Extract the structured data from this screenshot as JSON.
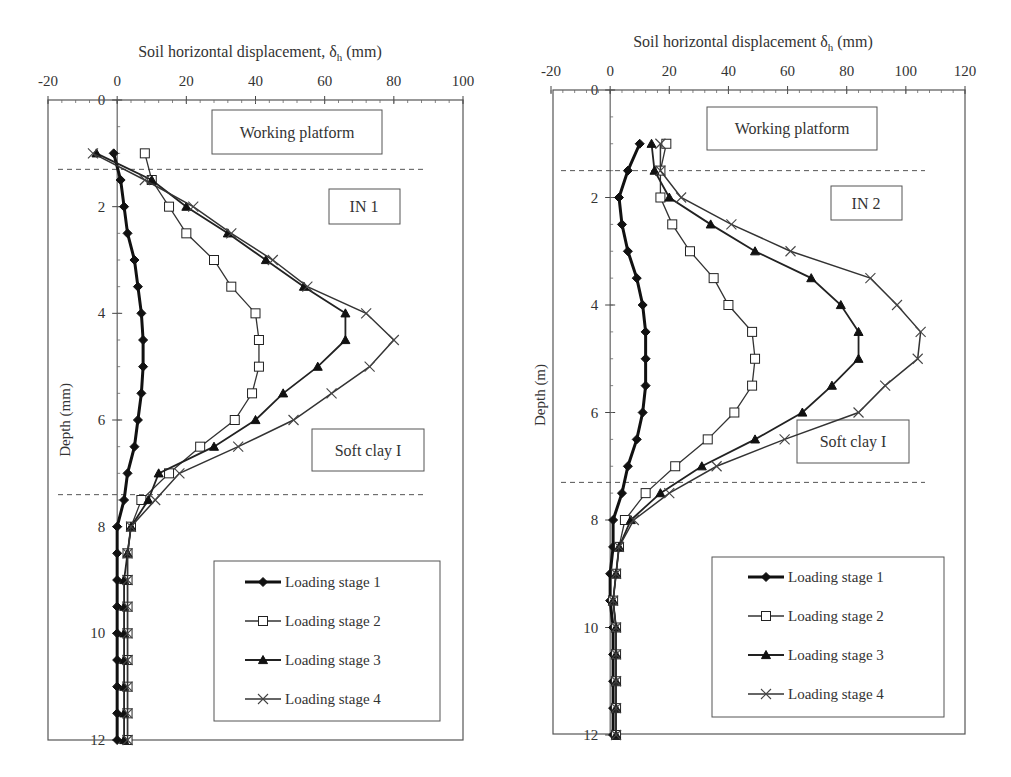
{
  "chart_data": [
    {
      "id": "IN1",
      "type": "line",
      "title": "",
      "xlabel": "Soil horizontal displacement, δh (mm)",
      "ylabel": "Depth (mm)",
      "xlim": [
        -20,
        100
      ],
      "ylim": [
        12,
        0
      ],
      "xticks": [
        "-20",
        "0",
        "20",
        "40",
        "60",
        "80",
        "100"
      ],
      "yticks": [
        "0",
        "2",
        "4",
        "6",
        "8",
        "10",
        "12"
      ],
      "grid": false,
      "legend_position": "lower right",
      "annotations": [
        "Working platform",
        "IN 1",
        "Soft clay I"
      ],
      "layer_boundaries_depth": [
        1.3,
        7.4
      ],
      "depth": [
        1,
        1.5,
        2,
        2.5,
        3,
        3.5,
        4,
        4.5,
        5,
        5.5,
        6,
        6.5,
        7,
        7.5,
        8,
        8.5,
        9,
        9.5,
        10,
        10.5,
        11,
        11.5,
        12
      ],
      "series": [
        {
          "name": "Loading stage 1",
          "marker": "diamond-filled",
          "values": [
            -1,
            1,
            2,
            3,
            5,
            6,
            7,
            7.5,
            7.5,
            7,
            6,
            5,
            3,
            2,
            0,
            0,
            0,
            0,
            0,
            0,
            0,
            0,
            0
          ]
        },
        {
          "name": "Loading stage 2",
          "marker": "square-open",
          "values": [
            8,
            10,
            15,
            20,
            28,
            33,
            40,
            41,
            41,
            39,
            34,
            24,
            15,
            7,
            4,
            3,
            3,
            3,
            3,
            3,
            3,
            3,
            3
          ]
        },
        {
          "name": "Loading stage 3",
          "marker": "triangle-filled",
          "values": [
            -6,
            10,
            20,
            32,
            43,
            54,
            66,
            66,
            58,
            48,
            40,
            28,
            12,
            9,
            4,
            3,
            2,
            2,
            2,
            2,
            2,
            2,
            2
          ]
        },
        {
          "name": "Loading stage 4",
          "marker": "x",
          "values": [
            -7,
            8,
            22,
            33,
            45,
            55,
            72,
            80,
            73,
            62,
            51,
            35,
            18,
            11,
            4,
            3,
            3,
            3,
            3,
            3,
            3,
            3,
            3
          ]
        }
      ]
    },
    {
      "id": "IN2",
      "type": "line",
      "title": "",
      "xlabel": "Soil horizontal displacement δh (mm)",
      "ylabel": "Depth (m)",
      "xlim": [
        -20,
        120
      ],
      "ylim": [
        12,
        0
      ],
      "xticks": [
        "-20",
        "0",
        "20",
        "40",
        "60",
        "80",
        "100",
        "120"
      ],
      "yticks": [
        "0",
        "2",
        "4",
        "6",
        "8",
        "10",
        "12"
      ],
      "grid": false,
      "legend_position": "lower right",
      "annotations": [
        "Working platform",
        "IN 2",
        "Soft clay I"
      ],
      "layer_boundaries_depth": [
        1.5,
        7.3
      ],
      "depth": [
        1,
        1.5,
        2,
        2.5,
        3,
        3.5,
        4,
        4.5,
        5,
        5.5,
        6,
        6.5,
        7,
        7.5,
        8,
        8.5,
        9,
        9.5,
        10,
        10.5,
        11,
        11.5,
        12
      ],
      "series": [
        {
          "name": "Loading stage 1",
          "marker": "diamond-filled",
          "values": [
            10,
            6,
            3,
            4,
            6,
            9,
            11,
            12,
            12,
            12,
            11,
            9,
            6,
            4,
            1,
            1,
            0,
            0,
            1,
            1,
            1,
            1,
            1
          ]
        },
        {
          "name": "Loading stage 2",
          "marker": "square-open",
          "values": [
            19,
            17,
            17,
            21,
            27,
            35,
            40,
            48,
            49,
            48,
            42,
            33,
            22,
            12,
            5,
            3,
            2,
            1,
            2,
            2,
            2,
            2,
            2
          ]
        },
        {
          "name": "Loading stage 3",
          "marker": "triangle-filled",
          "values": [
            14,
            15,
            20,
            34,
            49,
            68,
            78,
            84,
            84,
            75,
            65,
            49,
            31,
            17,
            7,
            3,
            2,
            1,
            2,
            2,
            2,
            2,
            2
          ]
        },
        {
          "name": "Loading stage 4",
          "marker": "x",
          "values": [
            17,
            17,
            24,
            41,
            61,
            88,
            97,
            105,
            104,
            93,
            84,
            59,
            36,
            20,
            8,
            3,
            2,
            1,
            2,
            2,
            2,
            2,
            2
          ]
        }
      ]
    }
  ],
  "charts": {
    "left": {
      "xlabel": "Soil horizontal displacement, δ",
      "xlabel_sub": "h",
      "xlabel_unit": " (mm)",
      "ylabel": "Depth (mm)",
      "box_working": "Working platform",
      "box_in": "IN 1",
      "box_clay": "Soft clay I"
    },
    "right": {
      "xlabel": "Soil horizontal displacement δ",
      "xlabel_sub": "h",
      "xlabel_unit": " (mm)",
      "ylabel": "Depth (m)",
      "box_working": "Working platform",
      "box_in": "IN 2",
      "box_clay": "Soft clay I"
    },
    "legend": [
      "Loading stage 1",
      "Loading stage 2",
      "Loading stage 3",
      "Loading stage 4"
    ]
  }
}
